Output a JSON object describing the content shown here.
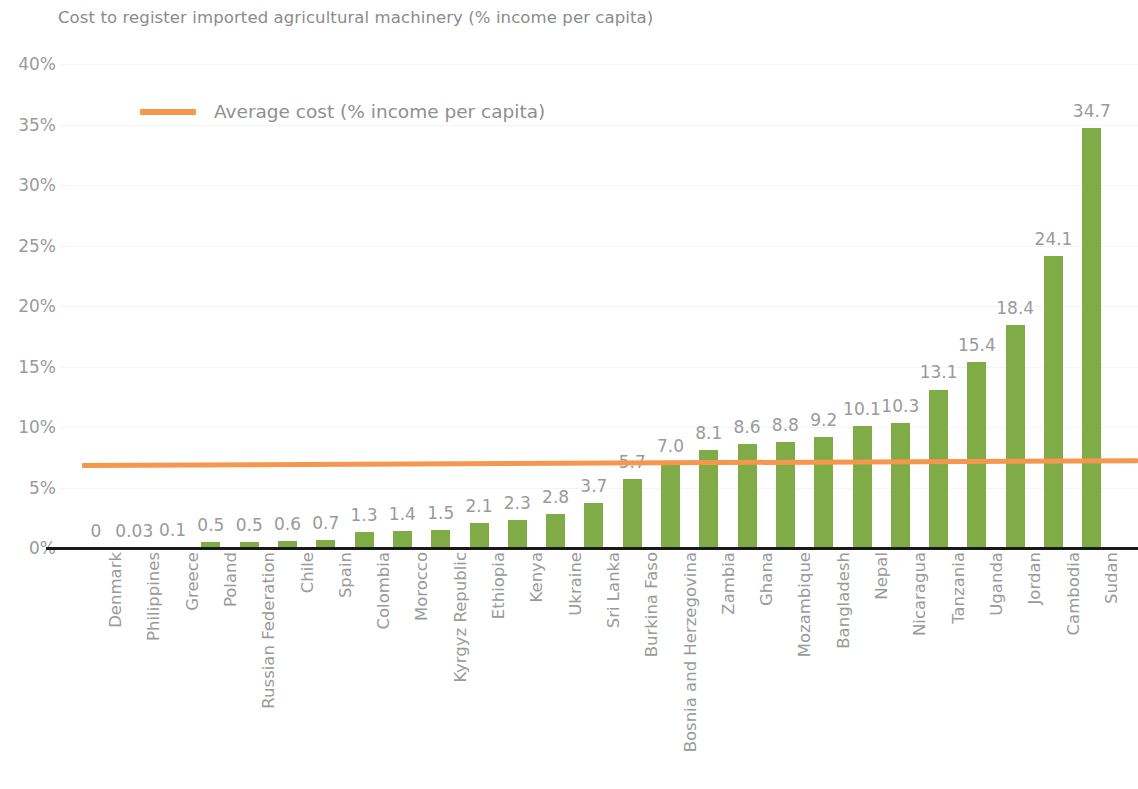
{
  "title": "Cost to register imported agricultural machinery (% income per capita)",
  "legend": {
    "series_label": "Average cost (% income per capita)",
    "marker": "orange-line-swatch"
  },
  "colors": {
    "bar": "#7fac46",
    "average_line": "#f5974e",
    "gridline": "#f4f4f4",
    "axis": "#1a1a1a",
    "text": "#9a9a9a"
  },
  "y_axis": {
    "ticks": [
      "0%",
      "5%",
      "10%",
      "15%",
      "20%",
      "25%",
      "30%",
      "35%",
      "40%"
    ],
    "tick_values": [
      0,
      5,
      10,
      15,
      20,
      25,
      30,
      35,
      40
    ]
  },
  "chart_data": {
    "type": "bar",
    "title": "Cost to register imported agricultural machinery (% income per capita)",
    "xlabel": "",
    "ylabel": "",
    "ylim": [
      0,
      40
    ],
    "grid": true,
    "legend_position": "top-left",
    "categories": [
      "Denmark",
      "Philippines",
      "Greece",
      "Poland",
      "Russian Federation",
      "Chile",
      "Spain",
      "Colombia",
      "Morocco",
      "Kyrgyz Republic",
      "Ethiopia",
      "Kenya",
      "Ukraine",
      "Sri Lanka",
      "Burkina Faso",
      "Bosnia and Herzegovina",
      "Zambia",
      "Ghana",
      "Mozambique",
      "Bangladesh",
      "Nepal",
      "Nicaragua",
      "Tanzania",
      "Uganda",
      "Jordan",
      "Cambodia",
      "Sudan"
    ],
    "values": [
      0,
      0.03,
      0.1,
      0.5,
      0.5,
      0.6,
      0.7,
      1.3,
      1.4,
      1.5,
      2.1,
      2.3,
      2.8,
      3.7,
      5.7,
      7.0,
      8.1,
      8.6,
      8.8,
      9.2,
      10.1,
      10.3,
      13.1,
      15.4,
      18.4,
      24.1,
      34.7
    ],
    "value_labels": [
      "0",
      "0.03",
      "0.1",
      "0.5",
      "0.5",
      "0.6",
      "0.7",
      "1.3",
      "1.4",
      "1.5",
      "2.1",
      "2.3",
      "2.8",
      "3.7",
      "5.7",
      "7.0",
      "8.1",
      "8.6",
      "8.8",
      "9.2",
      "10.1",
      "10.3",
      "13.1",
      "15.4",
      "18.4",
      "24.1",
      "34.7"
    ],
    "series": [
      {
        "name": "Cost to register imported agricultural machinery (% income per capita)",
        "type": "bar",
        "color": "#7fac46",
        "values": [
          0,
          0.03,
          0.1,
          0.5,
          0.5,
          0.6,
          0.7,
          1.3,
          1.4,
          1.5,
          2.1,
          2.3,
          2.8,
          3.7,
          5.7,
          7.0,
          8.1,
          8.6,
          8.8,
          9.2,
          10.1,
          10.3,
          13.1,
          15.4,
          18.4,
          24.1,
          34.7
        ]
      },
      {
        "name": "Average cost (% income per capita)",
        "type": "line",
        "color": "#f5974e",
        "values": [
          7.0,
          7.02,
          7.03,
          7.05,
          7.06,
          7.08,
          7.09,
          7.11,
          7.12,
          7.14,
          7.15,
          7.17,
          7.18,
          7.2,
          7.21,
          7.23,
          7.24,
          7.26,
          7.27,
          7.29,
          7.3,
          7.32,
          7.33,
          7.35,
          7.36,
          7.38,
          7.4
        ]
      }
    ]
  }
}
